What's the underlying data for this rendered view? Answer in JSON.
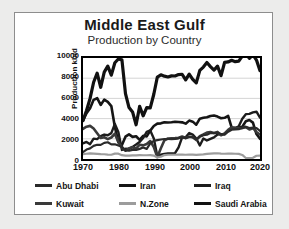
{
  "chart_data": {
    "type": "line",
    "title": "Middle East Gulf",
    "subtitle": "Production by Country",
    "xlabel": "",
    "ylabel": "Production kb/d",
    "xlim": [
      1970,
      2020
    ],
    "ylim": [
      0,
      10000
    ],
    "grid": true,
    "legend_position": "bottom",
    "xticks": [
      "1970",
      "1980",
      "1990",
      "2000",
      "2010",
      "2020"
    ],
    "yticks": [
      "0",
      "2000",
      "4000",
      "6000",
      "8000",
      "10000"
    ],
    "x": [
      1970,
      1971,
      1972,
      1973,
      1974,
      1975,
      1976,
      1977,
      1978,
      1979,
      1980,
      1981,
      1982,
      1983,
      1984,
      1985,
      1986,
      1987,
      1988,
      1989,
      1990,
      1991,
      1992,
      1993,
      1994,
      1995,
      1996,
      1997,
      1998,
      1999,
      2000,
      2001,
      2002,
      2003,
      2004,
      2005,
      2006,
      2007,
      2008,
      2009,
      2010,
      2011,
      2012,
      2013,
      2014,
      2015,
      2016,
      2017,
      2018,
      2019,
      2020
    ],
    "series": [
      {
        "name": "Saudi Arabia",
        "color": "#111111",
        "width": 3.2,
        "values": [
          3800,
          4800,
          6000,
          7600,
          8500,
          7100,
          8600,
          9200,
          8300,
          9530,
          9900,
          9815,
          6480,
          5090,
          4660,
          3390,
          5210,
          4270,
          5090,
          5060,
          6410,
          8115,
          8330,
          8200,
          8120,
          8230,
          8220,
          8360,
          8390,
          7830,
          8404,
          7890,
          7535,
          8775,
          9100,
          9550,
          9150,
          8800,
          9200,
          8250,
          9570,
          9610,
          9770,
          9640,
          9690,
          10190,
          10460,
          9960,
          10320,
          9800,
          8750
        ]
      },
      {
        "name": "Iran",
        "color": "#151515",
        "width": 2.6,
        "values": [
          3830,
          4540,
          5020,
          5860,
          6020,
          5350,
          5880,
          5660,
          5240,
          3170,
          1660,
          1380,
          2210,
          2440,
          2190,
          2250,
          1900,
          2300,
          2240,
          2810,
          3270,
          3500,
          3530,
          3640,
          3620,
          3640,
          3690,
          3660,
          3630,
          3500,
          3800,
          3700,
          3400,
          3990,
          4080,
          4130,
          4260,
          4300,
          4200,
          4040,
          4080,
          4280,
          3100,
          3060,
          3110,
          3200,
          3730,
          3860,
          3600,
          2470,
          2000
        ]
      },
      {
        "name": "Iraq",
        "color": "#1c1c1c",
        "width": 2.4,
        "values": [
          1550,
          1690,
          1470,
          2020,
          1970,
          2260,
          2420,
          2350,
          2560,
          3480,
          2650,
          900,
          1010,
          1000,
          1200,
          1430,
          1690,
          2080,
          2690,
          2830,
          2040,
          280,
          425,
          510,
          550,
          560,
          580,
          1160,
          2150,
          2150,
          2570,
          2420,
          2030,
          1340,
          2030,
          1830,
          1990,
          2140,
          2430,
          2450,
          2460,
          2800,
          3000,
          3050,
          3240,
          3990,
          4440,
          4470,
          4620,
          4680,
          4100
        ]
      },
      {
        "name": "Kuwait",
        "color": "#3a3a3a",
        "width": 2.6,
        "values": [
          2990,
          3200,
          3280,
          3020,
          2550,
          2080,
          2150,
          1970,
          2130,
          2500,
          1660,
          1130,
          820,
          1070,
          1160,
          1020,
          1420,
          1350,
          1490,
          1780,
          1180,
          190,
          1060,
          1850,
          2030,
          2060,
          2070,
          2110,
          2230,
          2080,
          2210,
          2150,
          1880,
          2260,
          2430,
          2620,
          2670,
          2580,
          2680,
          2350,
          2530,
          2880,
          3130,
          3090,
          3070,
          3060,
          3150,
          2930,
          3050,
          2680,
          2420
        ]
      },
      {
        "name": "Abu Dhabi",
        "color": "#2a2a2a",
        "width": 2.2,
        "values": [
          690,
          935,
          1050,
          1300,
          1410,
          1400,
          1600,
          1660,
          1450,
          1460,
          1330,
          1200,
          860,
          820,
          910,
          890,
          1000,
          1130,
          1000,
          1550,
          1800,
          1870,
          1930,
          1980,
          1980,
          1970,
          1980,
          2050,
          2140,
          2050,
          2200,
          2160,
          1960,
          2200,
          2360,
          2400,
          2570,
          2560,
          2600,
          2470,
          2420,
          2700,
          2900,
          2930,
          2950,
          3100,
          3200,
          3070,
          3100,
          3070,
          2770
        ]
      },
      {
        "name": "N.Zone",
        "color": "#9c9c9c",
        "width": 2.2,
        "values": [
          480,
          520,
          560,
          540,
          510,
          480,
          470,
          440,
          420,
          530,
          530,
          380,
          330,
          330,
          360,
          350,
          380,
          370,
          370,
          380,
          340,
          150,
          230,
          390,
          420,
          420,
          420,
          430,
          440,
          420,
          440,
          430,
          400,
          440,
          450,
          500,
          540,
          560,
          570,
          540,
          520,
          530,
          530,
          520,
          510,
          400,
          100,
          90,
          120,
          320,
          330
        ]
      }
    ]
  },
  "legend": {
    "rows": [
      [
        {
          "label": "Abu Dhabi",
          "color": "#2a2a2a"
        },
        {
          "label": "Iran",
          "color": "#151515"
        },
        {
          "label": "Iraq",
          "color": "#1c1c1c"
        }
      ],
      [
        {
          "label": "Kuwait",
          "color": "#3a3a3a"
        },
        {
          "label": "N.Zone",
          "color": "#9c9c9c"
        },
        {
          "label": "Saudi Arabia",
          "color": "#111111"
        }
      ]
    ]
  }
}
